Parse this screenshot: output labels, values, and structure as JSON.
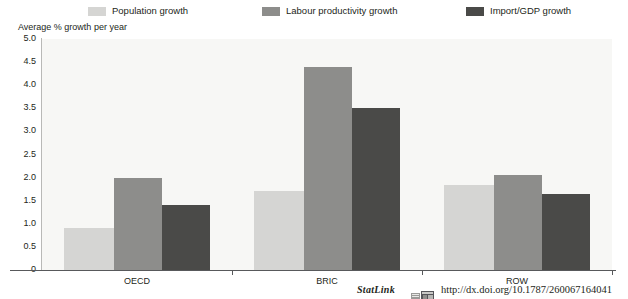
{
  "axis_title": "Average % growth per year",
  "colors": {
    "series_population": "#d5d5d3",
    "series_labour": "#8d8d8b",
    "series_import": "#4a4a48",
    "plot_background": "#f7f7f5",
    "axis_line": "#58595b"
  },
  "legend": {
    "items": [
      {
        "label": "Population growth",
        "color": "#d5d5d3"
      },
      {
        "label": "Labour productivity growth",
        "color": "#8d8d8b"
      },
      {
        "label": "Import/GDP growth",
        "color": "#4a4a48"
      }
    ]
  },
  "footer": {
    "statlink_label": "StatLink",
    "url": "http://dx.doi.org/10.1787/260067164041",
    "icon": "statlink-excel-icon"
  },
  "chart_data": {
    "type": "bar",
    "title": "",
    "subtitle": "",
    "xlabel": "",
    "ylabel": "Average % growth per year",
    "ylim": [
      0,
      5.0
    ],
    "ytick_labels": [
      "0",
      "0.5",
      "1.0",
      "1.5",
      "2.0",
      "2.5",
      "3.0",
      "3.5",
      "4.0",
      "4.5",
      "5.0"
    ],
    "ytick_values": [
      0,
      0.5,
      1.0,
      1.5,
      2.0,
      2.5,
      3.0,
      3.5,
      4.0,
      4.5,
      5.0
    ],
    "grid": false,
    "legend_position": "top",
    "categories": [
      "OECD",
      "BRIC",
      "ROW"
    ],
    "series": [
      {
        "name": "Population growth",
        "color": "#d5d5d3",
        "values": [
          0.9,
          1.7,
          1.85
        ]
      },
      {
        "name": "Labour productivity growth",
        "color": "#8d8d8b",
        "values": [
          2.0,
          4.4,
          2.05
        ]
      },
      {
        "name": "Import/GDP growth",
        "color": "#4a4a48",
        "values": [
          1.4,
          3.5,
          1.65
        ]
      }
    ]
  }
}
